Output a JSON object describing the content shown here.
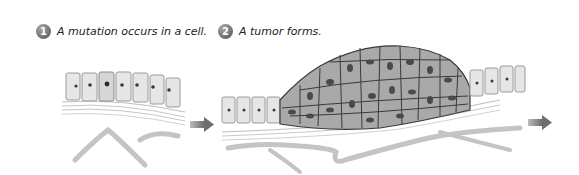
{
  "steps": [
    {
      "number": "1",
      "caption": "A mutation occurs in a cell."
    },
    {
      "number": "2",
      "caption": "A tumor forms."
    }
  ],
  "arrows": [
    {
      "name": "arrow-step1-to-step2",
      "color": "#7a7a7a"
    },
    {
      "name": "arrow-step2-to-next",
      "color": "#7a7a7a"
    }
  ],
  "colors": {
    "cell_fill": "#e6e6e6",
    "tumor_cell_fill": "#a9a9a9",
    "nucleus": "#3a3a3a",
    "tissue_stroke": "#b0b0b0",
    "vessel": "#c4c4c4"
  }
}
